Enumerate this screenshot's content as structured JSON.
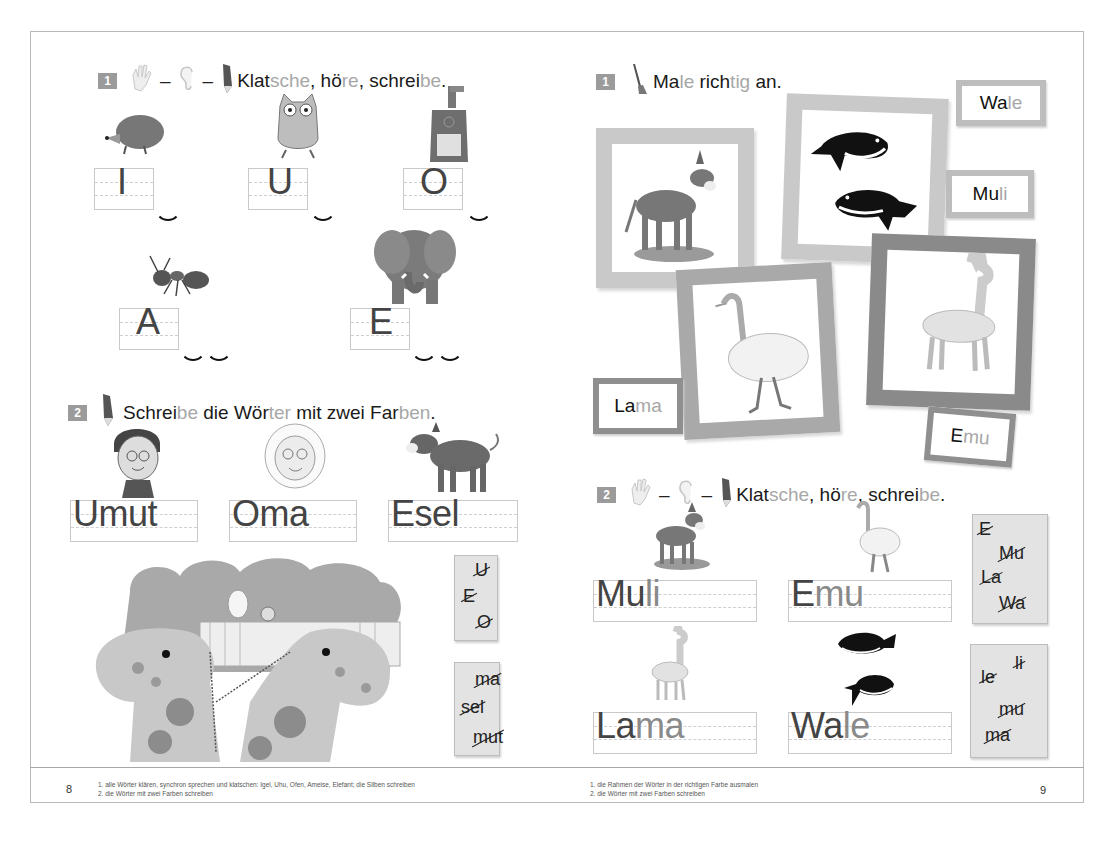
{
  "left_page": {
    "page_number": "8",
    "task1": {
      "number": "1",
      "icons": [
        "clapping-hands-icon",
        "ear-icon",
        "pencil-icon"
      ],
      "instruction_parts": [
        {
          "text": "Klat",
          "style": "dark"
        },
        {
          "text": "sche",
          "style": "light"
        },
        {
          "text": ", hö",
          "style": "dark"
        },
        {
          "text": "re",
          "style": "light"
        },
        {
          "text": ", schrei",
          "style": "dark"
        },
        {
          "text": "be",
          "style": "light"
        },
        {
          "text": ".",
          "style": "dark"
        }
      ],
      "items": [
        {
          "picture": "hedgehog",
          "letter": "I",
          "syllable_arcs": 1
        },
        {
          "picture": "owl",
          "letter": "U",
          "syllable_arcs": 1
        },
        {
          "picture": "stove",
          "letter": "O",
          "syllable_arcs": 1
        },
        {
          "picture": "ant",
          "letter": "A",
          "syllable_arcs": 2
        },
        {
          "picture": "elephant",
          "letter": "E",
          "syllable_arcs": 2
        }
      ]
    },
    "task2": {
      "number": "2",
      "icons": [
        "pencil-icon"
      ],
      "instruction_parts": [
        {
          "text": "Schrei",
          "style": "dark"
        },
        {
          "text": "be",
          "style": "light"
        },
        {
          "text": " die Wör",
          "style": "dark"
        },
        {
          "text": "ter",
          "style": "light"
        },
        {
          "text": " mit zwei Far",
          "style": "dark"
        },
        {
          "text": "ben",
          "style": "light"
        },
        {
          "text": ".",
          "style": "dark"
        }
      ],
      "words": [
        {
          "picture": "boy-umut",
          "first": "U",
          "rest": "mut"
        },
        {
          "picture": "grandma",
          "first": "O",
          "rest": "ma"
        },
        {
          "picture": "donkey",
          "first": "E",
          "rest": "sel"
        }
      ],
      "scene": "giraffes-at-zoo",
      "syllable_box_1": [
        "U",
        "E",
        "O"
      ],
      "syllable_box_2": [
        "ma",
        "sel",
        "mut"
      ]
    },
    "footer_notes": [
      "1. alle Wörter klären, synchron sprechen und klatschen: Igel, Uhu, Ofen, Ameise, Elefant; die Silben schreiben",
      "2. die Wörter mit zwei Farben schreiben"
    ]
  },
  "right_page": {
    "page_number": "9",
    "task1": {
      "number": "1",
      "icons": [
        "paintbrush-icon"
      ],
      "instruction_parts": [
        {
          "text": "Ma",
          "style": "dark"
        },
        {
          "text": "le",
          "style": "light"
        },
        {
          "text": " rich",
          "style": "dark"
        },
        {
          "text": "tig",
          "style": "light"
        },
        {
          "text": " an.",
          "style": "dark"
        }
      ],
      "word_cards": [
        {
          "first": "Wa",
          "rest": "le"
        },
        {
          "first": "Mu",
          "rest": "li"
        },
        {
          "first": "La",
          "rest": "ma"
        },
        {
          "first": "E",
          "rest": "mu"
        }
      ],
      "picture_frames": [
        "donkey",
        "whales",
        "emu",
        "llama"
      ]
    },
    "task2": {
      "number": "2",
      "icons": [
        "clapping-hands-icon",
        "ear-icon",
        "pencil-icon"
      ],
      "instruction_parts": [
        {
          "text": "Klat",
          "style": "dark"
        },
        {
          "text": "sche",
          "style": "light"
        },
        {
          "text": ", hö",
          "style": "dark"
        },
        {
          "text": "re",
          "style": "light"
        },
        {
          "text": ", schrei",
          "style": "dark"
        },
        {
          "text": "be",
          "style": "light"
        },
        {
          "text": ".",
          "style": "dark"
        }
      ],
      "words": [
        {
          "picture": "mule",
          "first": "Mu",
          "rest": "li"
        },
        {
          "picture": "emu",
          "first": "E",
          "rest": "mu"
        },
        {
          "picture": "llama",
          "first": "La",
          "rest": "ma"
        },
        {
          "picture": "whales",
          "first": "Wa",
          "rest": "le"
        }
      ],
      "syllable_box_1": [
        "E",
        "Mu",
        "La",
        "Wa"
      ],
      "syllable_box_2": [
        "li",
        "le",
        "mu",
        "ma"
      ]
    },
    "footer_notes": [
      "1. die Rahmen der Wörter in der richtigen Farbe ausmalen",
      "2. die Wörter mit zwei Farben schreiben"
    ]
  },
  "colors": {
    "text_dark": "#1a1a1a",
    "text_light_syllable": "#a7a7a7",
    "badge": "#9b9b9b",
    "frame_light": "#c9c9c9",
    "frame_dark": "#8a8a8a"
  }
}
